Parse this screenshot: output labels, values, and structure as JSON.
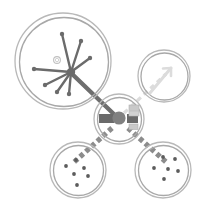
{
  "canvas": {
    "width": 201,
    "height": 207,
    "background": "#ffffff",
    "title": "Abstract node-link schematic"
  },
  "palette": {
    "ring_outer": "#b3b3b3",
    "ring_inner": "#9e9e9e",
    "hub_fill": "#808080",
    "link_solid": "#6e6e6e",
    "link_dashed": "#8c8c8c",
    "link_faint": "#d8d8d8",
    "ray": "#6b6b6b",
    "dot": "#5c5c5c",
    "block_dark": "#6a6a6a",
    "block_light": "#c9c9c9"
  },
  "nodes": [
    {
      "id": "node-top-left",
      "label": "starburst-node",
      "cx": 63,
      "cy": 61,
      "r_outer": 48,
      "r_inner": 44,
      "content": "starburst-rays",
      "ring_style": "double"
    },
    {
      "id": "node-top-right",
      "label": "arrow-node",
      "cx": 164,
      "cy": 76,
      "r_outer": 26,
      "r_inner": 23,
      "content": "arrow-glyph",
      "ring_style": "double"
    },
    {
      "id": "node-bottom-left",
      "label": "scatter-node-left",
      "cx": 78,
      "cy": 170,
      "r_outer": 28,
      "r_inner": 25,
      "content": "scatter-dots",
      "ring_style": "double"
    },
    {
      "id": "node-bottom-right",
      "label": "scatter-node-right",
      "cx": 163,
      "cy": 170,
      "r_outer": 28,
      "r_inner": 25,
      "content": "scatter-dots",
      "ring_style": "double"
    },
    {
      "id": "node-hub",
      "label": "central-hub",
      "cx": 119,
      "cy": 119,
      "r_outer": 25,
      "r_inner": 22,
      "content": "hub-core",
      "ring_style": "double"
    }
  ],
  "links": [
    {
      "id": "link-hub-to-topleft",
      "from": "node-hub",
      "to": "node-top-left",
      "style": "solid-thick",
      "color": "#6e6e6e",
      "width": 4.2
    },
    {
      "id": "link-hub-to-topright",
      "from": "node-hub",
      "to": "node-top-right",
      "style": "dashed-faint",
      "color": "#d8d8d8",
      "width": 3.2
    },
    {
      "id": "link-hub-to-bottomleft",
      "from": "node-hub",
      "to": "node-bottom-left",
      "style": "dashed-square",
      "color": "#8c8c8c",
      "width": 5
    },
    {
      "id": "link-hub-to-bottomright",
      "from": "node-hub",
      "to": "node-bottom-right",
      "style": "dashed-square",
      "color": "#8c8c8c",
      "width": 5
    }
  ],
  "starburst": {
    "origin_x": 71,
    "origin_y": 72,
    "hub_dot_r": 4.2,
    "small_ring": {
      "cx": 57,
      "cy": 60,
      "r": 3.4
    },
    "rays": [
      {
        "angle_deg": -104,
        "length": 39,
        "tip": "dot"
      },
      {
        "angle_deg": -72,
        "length": 33,
        "tip": "dot"
      },
      {
        "angle_deg": -36,
        "length": 24,
        "tip": "dot"
      },
      {
        "angle_deg": 176,
        "length": 37,
        "tip": "dot"
      },
      {
        "angle_deg": 150,
        "length": 27,
        "tip": "dot"
      },
      {
        "angle_deg": 124,
        "length": 25,
        "tip": "dot"
      },
      {
        "angle_deg": 96,
        "length": 22,
        "tip": "dot"
      }
    ]
  },
  "hub_core": {
    "center_dot_r": 6.5,
    "left_block": {
      "x": 99,
      "y": 114,
      "w": 15,
      "h": 9,
      "color": "#6a6a6a"
    },
    "right_block": {
      "x": 127,
      "y": 114,
      "w": 11,
      "h": 9,
      "color": "#6a6a6a"
    },
    "right_small_blocks": [
      {
        "x": 129,
        "y": 105,
        "w": 10,
        "h": 6,
        "color": "#c9c9c9"
      },
      {
        "x": 129,
        "y": 112,
        "w": 10,
        "h": 5,
        "color": "#c9c9c9"
      },
      {
        "x": 129,
        "y": 124,
        "w": 9,
        "h": 6,
        "color": "#c9c9c9"
      }
    ]
  },
  "scatter_dots": {
    "radius": 1.8,
    "left_node_points": [
      {
        "dx": -12,
        "dy": -4
      },
      {
        "dx": -2,
        "dy": -10
      },
      {
        "dx": 6,
        "dy": -2
      },
      {
        "dx": -4,
        "dy": 4
      },
      {
        "dx": 10,
        "dy": 6
      },
      {
        "dx": -1,
        "dy": 15
      }
    ],
    "right_node_points": [
      {
        "dx": 0,
        "dy": -13
      },
      {
        "dx": 12,
        "dy": -11
      },
      {
        "dx": -9,
        "dy": -2
      },
      {
        "dx": 5,
        "dy": -1
      },
      {
        "dx": 15,
        "dy": 1
      },
      {
        "dx": 1,
        "dy": 9
      }
    ]
  },
  "arrow_glyph": {
    "color": "#dcdcdc",
    "shaft_from": {
      "x": 148,
      "y": 92
    },
    "shaft_to": {
      "x": 172,
      "y": 67
    },
    "head_size": 7,
    "width": 3
  }
}
